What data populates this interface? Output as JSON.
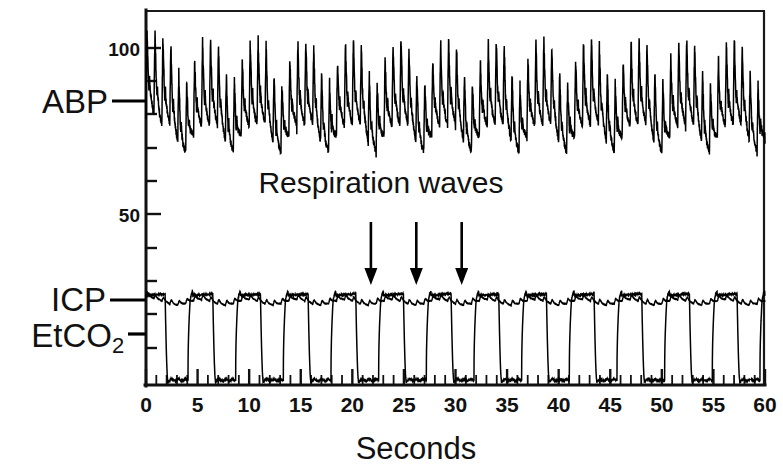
{
  "chart_data": {
    "type": "line",
    "title": "",
    "xlabel": "Seconds",
    "ylabel": "",
    "xlim": [
      0,
      60
    ],
    "ylim": [
      0,
      120
    ],
    "grid": false,
    "legend_position": "left-axis-inline",
    "xticks": [
      0,
      5,
      10,
      15,
      20,
      25,
      30,
      35,
      40,
      45,
      50,
      55,
      60
    ],
    "xtick_labels": [
      "0",
      "5",
      "10",
      "15",
      "20",
      "25",
      "30",
      "35",
      "40",
      "45",
      "50",
      "55",
      "60"
    ],
    "xtick_minor_interval": 1,
    "yticks": [
      50,
      100
    ],
    "ytick_labels": [
      "50",
      "100"
    ],
    "ytick_minor": [
      10,
      20,
      30,
      40,
      60,
      70,
      80,
      90,
      110
    ],
    "annotations": [
      {
        "text": "Respiration waves",
        "x_seconds": 26.5,
        "y_value": 69,
        "arrow_x_seconds": [
          21.8,
          26.2,
          30.6
        ],
        "arrow_count": 3,
        "arrow_direction": "down"
      }
    ],
    "series": [
      {
        "name": "ABP",
        "label": "ABP",
        "units": "mmHg",
        "description": "Arterial blood pressure pulse train with respiratory amplitude modulation",
        "axis_marker_y_value": 80,
        "systolic_mean": 97,
        "diastolic_mean": 72,
        "pulse_rate_bpm": 78,
        "respiration_period_seconds": 4.62,
        "respiration_modulation_mmHg": 7,
        "ymin_observed": 62,
        "ymax_observed": 104
      },
      {
        "name": "ICP",
        "label": "ICP",
        "units": "mmHg",
        "description": "Intracranial pressure, low-amplitude pulsatile baseline near plateau level",
        "axis_marker_y_value": 25,
        "mean_value": 24,
        "amplitude": 1.6,
        "ymin_observed": 22,
        "ymax_observed": 27
      },
      {
        "name": "EtCO2",
        "label": "EtCO2",
        "label_base": "EtCO",
        "label_subscript": "2",
        "units": "mmHg",
        "description": "Capnogram square waves; expiratory plateau with inspiratory drop to baseline",
        "axis_marker_y_value": 14,
        "plateau_value": 26,
        "baseline_value": 0,
        "breath_period_seconds": 4.62,
        "breaths_per_minute": 13,
        "ymin_observed": 0,
        "ymax_observed": 27
      }
    ]
  },
  "axis": {
    "x_title": "Seconds",
    "y_tick_100": "100",
    "y_tick_50": "50"
  },
  "labels": {
    "abp": "ABP",
    "icp": "ICP",
    "etco2_base": "EtCO",
    "etco2_sub": "2",
    "respiration_waves": "Respiration waves"
  },
  "xtick_labels": {
    "t0": "0",
    "t5": "5",
    "t10": "10",
    "t15": "15",
    "t20": "20",
    "t25": "25",
    "t30": "30",
    "t35": "35",
    "t40": "40",
    "t45": "45",
    "t50": "50",
    "t55": "55",
    "t60": "60"
  },
  "colors": {
    "trace": "#000000",
    "axis": "#111111",
    "background": "#ffffff"
  }
}
